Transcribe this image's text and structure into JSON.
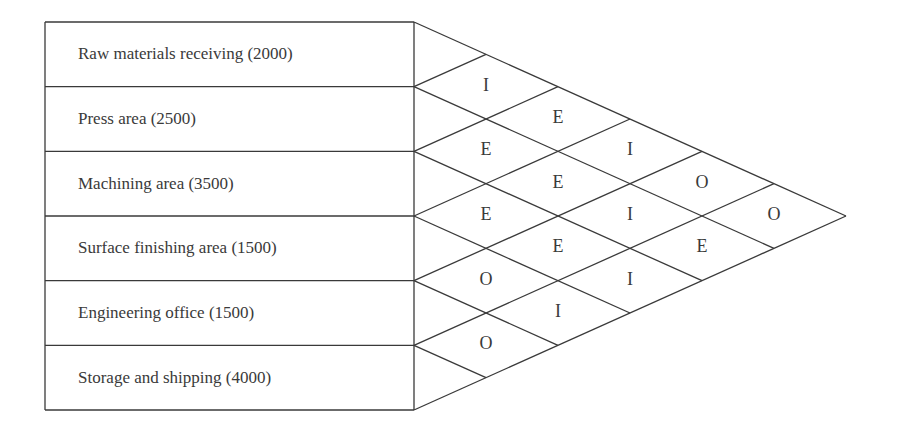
{
  "chart_data": {
    "type": "relationship-chart",
    "title": "",
    "departments": [
      {
        "name": "Raw materials receiving",
        "area": 2000,
        "label": "Raw materials receiving (2000)"
      },
      {
        "name": "Press area",
        "area": 2500,
        "label": "Press area (2500)"
      },
      {
        "name": "Machining area",
        "area": 3500,
        "label": "Machining area (3500)"
      },
      {
        "name": "Surface finishing area",
        "area": 1500,
        "label": "Surface finishing area (1500)"
      },
      {
        "name": "Engineering office",
        "area": 1500,
        "label": "Engineering office (1500)"
      },
      {
        "name": "Storage and shipping",
        "area": 4000,
        "label": "Storage and shipping (4000)"
      }
    ],
    "relationships": [
      {
        "from": 0,
        "to": 1,
        "code": "I"
      },
      {
        "from": 0,
        "to": 2,
        "code": "E"
      },
      {
        "from": 0,
        "to": 3,
        "code": "I"
      },
      {
        "from": 0,
        "to": 4,
        "code": "O"
      },
      {
        "from": 0,
        "to": 5,
        "code": "O"
      },
      {
        "from": 1,
        "to": 2,
        "code": "E"
      },
      {
        "from": 1,
        "to": 3,
        "code": "E"
      },
      {
        "from": 1,
        "to": 4,
        "code": "I"
      },
      {
        "from": 1,
        "to": 5,
        "code": "E"
      },
      {
        "from": 2,
        "to": 3,
        "code": "E"
      },
      {
        "from": 2,
        "to": 4,
        "code": "E"
      },
      {
        "from": 2,
        "to": 5,
        "code": "I"
      },
      {
        "from": 3,
        "to": 4,
        "code": "O"
      },
      {
        "from": 3,
        "to": 5,
        "code": "I"
      },
      {
        "from": 4,
        "to": 5,
        "code": "O"
      }
    ]
  },
  "colors": {
    "line": "#3a3a3a",
    "text": "#3a3a3a",
    "background": "#ffffff"
  }
}
